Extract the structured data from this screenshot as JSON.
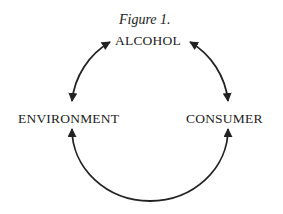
{
  "figure": {
    "title": "Figure 1.",
    "nodes": {
      "top": "ALCOHOL",
      "left": "ENVIRONMENT",
      "right": "CONSUMER"
    },
    "edges": [
      {
        "from": "ALCOHOL",
        "to": "ENVIRONMENT",
        "direction": "bidirectional"
      },
      {
        "from": "ALCOHOL",
        "to": "CONSUMER",
        "direction": "bidirectional"
      },
      {
        "from": "ENVIRONMENT",
        "to": "CONSUMER",
        "direction": "bidirectional"
      }
    ]
  }
}
